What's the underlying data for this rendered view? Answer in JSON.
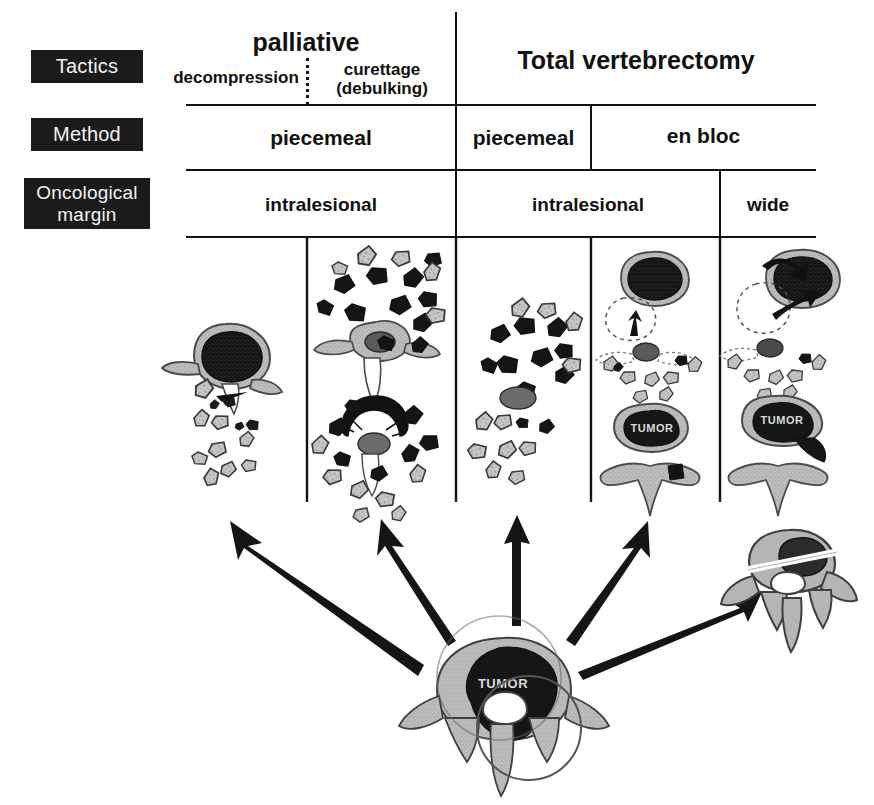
{
  "figure": {
    "type": "medical-classification-diagram"
  },
  "row_labels": [
    {
      "key": "tactics",
      "label": "Tactics"
    },
    {
      "key": "method",
      "label": "Method"
    },
    {
      "key": "margin",
      "label": "Oncological margin"
    },
    {
      "key": "margin_line1",
      "label": "Oncological"
    },
    {
      "key": "margin_line2",
      "label": "margin"
    }
  ],
  "tactics_row": {
    "palliative_group": "palliative",
    "palliative_columns": [
      {
        "label": "decompression"
      },
      {
        "label_line1": "curettage",
        "label_line2": "(debulking)"
      }
    ],
    "total_group": "Total vertebrectomy"
  },
  "method_row": [
    {
      "label": "piecemeal",
      "span": "palliative"
    },
    {
      "label": "piecemeal",
      "span": "total-piecemeal"
    },
    {
      "label": "en bloc",
      "span": "total-enbloc"
    }
  ],
  "margin_row": [
    {
      "label": "intralesional",
      "span": "palliative"
    },
    {
      "label": "intralesional",
      "span": "total-intralesional"
    },
    {
      "label": "wide",
      "span": "total-wide"
    }
  ],
  "illustrations": {
    "columns": [
      {
        "key": "decompression",
        "tumor_label": ""
      },
      {
        "key": "curettage",
        "tumor_label": ""
      },
      {
        "key": "piecemeal-total",
        "tumor_label": ""
      },
      {
        "key": "enbloc-intralesional",
        "tumor_label": "TUMOR"
      },
      {
        "key": "enbloc-wide",
        "tumor_label": "TUMOR"
      }
    ],
    "source": {
      "key": "source-vertebra",
      "tumor_label": "TUMOR"
    },
    "specimen": {
      "key": "wide-specimen",
      "tumor_label": ""
    }
  },
  "arrows": {
    "count": 5,
    "description": "five arrows radiating from the central tumour vertebra to each treatment column"
  },
  "colors": {
    "ink": "#111111",
    "label_box": "#1b1b1b",
    "label_text": "#f2f2f2",
    "bone_fill": "#b9b9b9",
    "bone_stroke": "#3a3a3a",
    "tumor_fill": "#1a1a1a",
    "background": "#ffffff"
  }
}
